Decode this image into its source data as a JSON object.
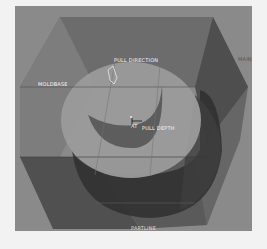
{
  "figure": {
    "type": "3d-cad-render",
    "colors": {
      "page_background": "#f2f2f2",
      "panel_background": "#8a8a8a",
      "box_top": "#6e6e6e",
      "box_left": "#7a7a7a",
      "box_right": "#5a5a5a",
      "box_bottom": "#585858",
      "box_lower_left": "#4a4a4a",
      "ring_face": "#9a9a9a",
      "ring_side": "#555555",
      "crescent": "#5e5e5e",
      "shadow": "#2e2e2e",
      "label_text": "#f4f4f4"
    },
    "labels": {
      "top": "PULL DIRECTION",
      "left": "MOLDBASE",
      "right": "MAIN",
      "center": "PULL DEPTH",
      "center_prefix": "AT",
      "bottom": "PARTLINE"
    }
  }
}
